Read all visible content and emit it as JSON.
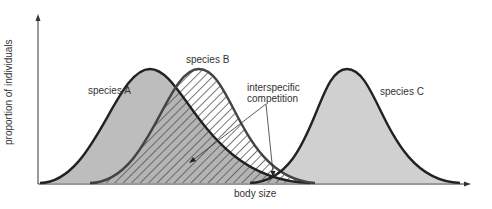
{
  "diagram": {
    "type": "overlapping-distribution-curves",
    "axes": {
      "x_label": "body size",
      "y_label": "proportion of individuals"
    },
    "species": [
      {
        "name": "species A",
        "fill": "#bdbdbd",
        "pattern": "solid"
      },
      {
        "name": "species B",
        "fill": "#ffffff",
        "pattern": "hatched"
      },
      {
        "name": "species C",
        "fill": "#d0d0d0",
        "pattern": "solid"
      }
    ],
    "annotation": {
      "line1": "interspecific",
      "line2": "competition",
      "points_to": [
        "overlap of species A and species B",
        "overlap of species B and species C"
      ]
    },
    "colors": {
      "outline": "#222222",
      "fill_a": "#bdbdbd",
      "fill_c": "#d0d0d0",
      "hatch": "#555555",
      "axis": "#333333"
    }
  }
}
